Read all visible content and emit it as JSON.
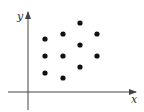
{
  "chart_data": {
    "type": "scatter",
    "title": "",
    "xlabel": "x",
    "ylabel": "y",
    "grid": false,
    "legend": null,
    "points": [
      {
        "x": 80,
        "y": 23
      },
      {
        "x": 63,
        "y": 34
      },
      {
        "x": 97,
        "y": 34
      },
      {
        "x": 45,
        "y": 39
      },
      {
        "x": 80,
        "y": 45
      },
      {
        "x": 45,
        "y": 56
      },
      {
        "x": 63,
        "y": 56
      },
      {
        "x": 97,
        "y": 56
      },
      {
        "x": 80,
        "y": 67
      },
      {
        "x": 45,
        "y": 73
      },
      {
        "x": 63,
        "y": 78
      }
    ],
    "point_units": "pixel positions (no tick labels shown)",
    "colors": {
      "points": "#111111",
      "axes": "#444444"
    }
  },
  "axes": {
    "x_label": "x",
    "y_label": "y"
  }
}
